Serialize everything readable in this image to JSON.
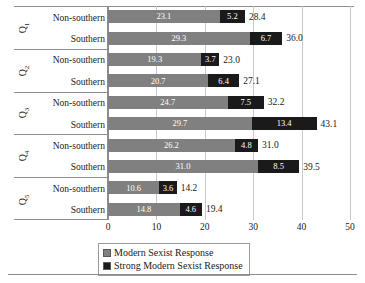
{
  "chart_data": {
    "type": "bar",
    "orientation": "horizontal",
    "stacked": true,
    "title": "",
    "xlabel": "",
    "ylabel": "",
    "xlim": [
      0,
      50
    ],
    "xticks": [
      0,
      10,
      20,
      30,
      40,
      50
    ],
    "xtick_labels": [
      "0",
      "10",
      "20",
      "30",
      "40",
      "50"
    ],
    "grid": true,
    "legend_position": "bottom",
    "series": [
      {
        "name": "Modern Sexist Response",
        "color": "#808080",
        "values": [
          23.1,
          29.3,
          19.3,
          20.7,
          24.7,
          29.7,
          26.2,
          31.0,
          10.6,
          14.8
        ]
      },
      {
        "name": "Strong Modern Sexist Response",
        "color": "#1a1a1a",
        "values": [
          5.2,
          6.7,
          3.7,
          6.4,
          7.5,
          13.4,
          4.8,
          8.5,
          3.6,
          4.6
        ]
      }
    ],
    "categories": [
      "Q1 Non-southern",
      "Q1 Southern",
      "Q2 Non-southern",
      "Q2 Southern",
      "Q3 Non-southern",
      "Q3 Southern",
      "Q4 Non-southern",
      "Q4 Southern",
      "Q5 Non-southern",
      "Q5 Southern"
    ],
    "totals": [
      28.4,
      36.0,
      23.0,
      27.1,
      32.2,
      43.1,
      31.0,
      39.5,
      14.2,
      19.4
    ]
  },
  "groups": [
    {
      "tag": "Q",
      "tag_sub": "1",
      "rows": [
        {
          "label": "Non-southern",
          "modern": 23.1,
          "strong": 5.2,
          "modern_text": "23.1",
          "strong_text": "5.2",
          "total_text": "28.4"
        },
        {
          "label": "Southern",
          "modern": 29.3,
          "strong": 6.7,
          "modern_text": "29.3",
          "strong_text": "6.7",
          "total_text": "36.0"
        }
      ]
    },
    {
      "tag": "Q",
      "tag_sub": "2",
      "rows": [
        {
          "label": "Non-southern",
          "modern": 19.3,
          "strong": 3.7,
          "modern_text": "19.3",
          "strong_text": "3.7",
          "total_text": "23.0"
        },
        {
          "label": "Southern",
          "modern": 20.7,
          "strong": 6.4,
          "modern_text": "20.7",
          "strong_text": "6.4",
          "total_text": "27.1"
        }
      ]
    },
    {
      "tag": "Q",
      "tag_sub": "3",
      "rows": [
        {
          "label": "Non-southern",
          "modern": 24.7,
          "strong": 7.5,
          "modern_text": "24.7",
          "strong_text": "7.5",
          "total_text": "32.2"
        },
        {
          "label": "Southern",
          "modern": 29.7,
          "strong": 13.4,
          "modern_text": "29.7",
          "strong_text": "13.4",
          "total_text": "43.1"
        }
      ]
    },
    {
      "tag": "Q",
      "tag_sub": "4",
      "rows": [
        {
          "label": "Non-southern",
          "modern": 26.2,
          "strong": 4.8,
          "modern_text": "26.2",
          "strong_text": "4.8",
          "total_text": "31.0"
        },
        {
          "label": "Southern",
          "modern": 31.0,
          "strong": 8.5,
          "modern_text": "31.0",
          "strong_text": "8.5",
          "total_text": "39.5"
        }
      ]
    },
    {
      "tag": "Q",
      "tag_sub": "5",
      "rows": [
        {
          "label": "Non-southern",
          "modern": 10.6,
          "strong": 3.6,
          "modern_text": "10.6",
          "strong_text": "3.6",
          "total_text": "14.2"
        },
        {
          "label": "Southern",
          "modern": 14.8,
          "strong": 4.6,
          "modern_text": "14.8",
          "strong_text": "4.6",
          "total_text": "19.4"
        }
      ]
    }
  ],
  "axis": {
    "ticks": [
      "0",
      "10",
      "20",
      "30",
      "40",
      "50"
    ],
    "tick_values": [
      0,
      10,
      20,
      30,
      40,
      50
    ]
  },
  "legend": {
    "items": [
      {
        "label": "Modern Sexist Response",
        "color": "#808080"
      },
      {
        "label": "Strong Modern Sexist Response",
        "color": "#1a1a1a"
      }
    ]
  },
  "colors": {
    "modern": "#808080",
    "strong": "#1a1a1a",
    "grid": "#c9c9c9",
    "frame": "#8c8c8c",
    "background": "#ffffff"
  }
}
